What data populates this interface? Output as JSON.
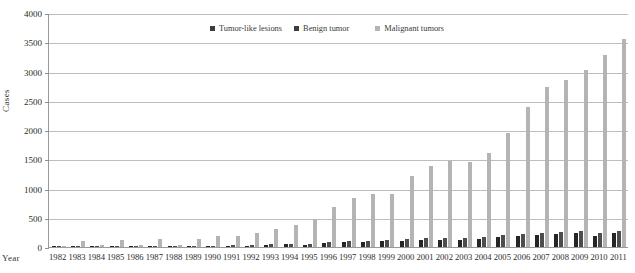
{
  "chart_data": {
    "type": "bar",
    "title": "",
    "xlabel": "Year",
    "ylabel": "Cases",
    "ylim": [
      0,
      4000
    ],
    "ytick_values": [
      0,
      500,
      1000,
      1500,
      2000,
      2500,
      3000,
      3500,
      4000
    ],
    "ytick_labels": [
      "0",
      "500",
      "1000",
      "1500",
      "2000",
      "2500",
      "3000",
      "3500",
      "4000"
    ],
    "grid": true,
    "legend_position": "top-center-inside",
    "categories": [
      "1982",
      "1983",
      "1984",
      "1985",
      "1986",
      "1987",
      "1988",
      "1989",
      "1990",
      "1991",
      "1992",
      "1993",
      "1994",
      "1995",
      "1996",
      "1997",
      "1998",
      "1999",
      "2000",
      "2001",
      "2002",
      "2003",
      "2004",
      "2005",
      "2006",
      "2007",
      "2008",
      "2009",
      "2010",
      "2011"
    ],
    "series": [
      {
        "name": "Tumor-like lesions",
        "color": "#262626",
        "values": [
          2,
          6,
          5,
          8,
          4,
          10,
          8,
          12,
          14,
          16,
          22,
          40,
          48,
          30,
          66,
          78,
          82,
          96,
          110,
          124,
          118,
          126,
          140,
          172,
          182,
          200,
          214,
          238,
          196,
          232
        ]
      },
      {
        "name": "Benign tumor",
        "color": "#4d4d4d",
        "values": [
          4,
          10,
          8,
          12,
          8,
          14,
          12,
          18,
          22,
          26,
          34,
          52,
          60,
          44,
          84,
          96,
          104,
          118,
          136,
          150,
          146,
          158,
          176,
          206,
          220,
          240,
          256,
          276,
          240,
          278
        ]
      },
      {
        "name": "Malignant tumors",
        "color": "#b4b4b4",
        "values": [
          18,
          104,
          34,
          112,
          26,
          130,
          40,
          140,
          185,
          196,
          235,
          310,
          370,
          480,
          690,
          840,
          900,
          905,
          1215,
          1390,
          1470,
          1460,
          1600,
          1945,
          2400,
          2740,
          2860,
          3020,
          3280,
          3560
        ]
      }
    ]
  },
  "legend": {
    "items": [
      {
        "label": "Tumor-like lesions"
      },
      {
        "label": "Benign tumor"
      },
      {
        "label": "Malignant tumors"
      }
    ]
  },
  "axes": {
    "y_title": "Cases",
    "x_title": "Year"
  }
}
